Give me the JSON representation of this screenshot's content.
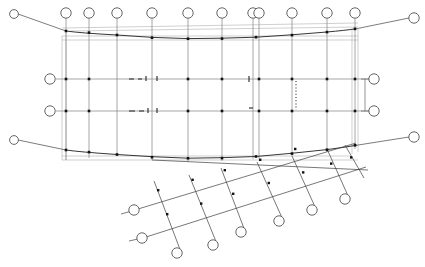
{
  "drawing": {
    "title": "Structural Column Grid Plan",
    "background_color": "#ffffff",
    "line_color": "#8a8a8a",
    "edge_color": "#2b2b2b",
    "node_color": "#111111",
    "bubble_fill": "#ffffff",
    "bubble_stroke": "#555555",
    "width": 425,
    "height": 267,
    "bubble_radius": 5.2,
    "node_size": 2.6
  },
  "chart_data": {
    "type": "scatter",
    "xlabel": "",
    "ylabel": "",
    "grid": true,
    "legend_position": "none"
  },
  "main_grid": {
    "columns": [
      {
        "name": "col-1",
        "x": 66,
        "bubble": {
          "cx": 66,
          "cy": 13,
          "r": 5.2
        },
        "top_y": 31,
        "bottom_y": 158
      },
      {
        "name": "col-2",
        "x": 89,
        "bubble": {
          "cx": 89,
          "cy": 13,
          "r": 5.2
        },
        "top_y": 32,
        "bottom_y": 155
      },
      {
        "name": "col-3",
        "x": 117,
        "bubble": {
          "cx": 117,
          "cy": 13,
          "r": 5.2
        },
        "top_y": 34,
        "bottom_y": 153
      },
      {
        "name": "col-4",
        "x": 152,
        "bubble": {
          "cx": 152,
          "cy": 13,
          "r": 5.2
        },
        "top_y": 37,
        "bottom_y": 157
      },
      {
        "name": "col-5",
        "x": 188,
        "bubble": {
          "cx": 188,
          "cy": 13,
          "r": 5.2
        },
        "top_y": 38,
        "bottom_y": 159
      },
      {
        "name": "col-6",
        "x": 222,
        "bubble": {
          "cx": 222,
          "cy": 13,
          "r": 5.2
        },
        "top_y": 38,
        "bottom_y": 158
      },
      {
        "name": "col-7",
        "x": 256,
        "bubble": {
          "cx": 253,
          "cy": 13,
          "r": 5.2
        },
        "top_y": 37,
        "bottom_y": 156
      },
      {
        "name": "col-7b",
        "x": 261,
        "bubble": {
          "cx": 259,
          "cy": 13,
          "r": 5.2
        },
        "top_y": 37,
        "bottom_y": 156
      },
      {
        "name": "col-8",
        "x": 292,
        "bubble": {
          "cx": 292,
          "cy": 13,
          "r": 5.2
        },
        "top_y": 34,
        "bottom_y": 153
      },
      {
        "name": "col-9",
        "x": 327,
        "bubble": {
          "cx": 327,
          "cy": 13,
          "r": 5.2
        },
        "top_y": 32,
        "bottom_y": 149
      },
      {
        "name": "col-10",
        "x": 355,
        "bubble": {
          "cx": 355,
          "cy": 13,
          "r": 5.2
        },
        "top_y": 29,
        "bottom_y": 146
      }
    ],
    "rows": [
      {
        "name": "row-A",
        "y": 79,
        "bubble_left": {
          "cx": 50,
          "cy": 79,
          "r": 5.2
        },
        "bubble_right": {
          "cx": 374,
          "cy": 79,
          "r": 5.2
        }
      },
      {
        "name": "row-B",
        "y": 111,
        "bubble_left": {
          "cx": 50,
          "cy": 111,
          "r": 5.2
        },
        "bubble_right": {
          "cx": 374,
          "cy": 111,
          "r": 5.2
        }
      }
    ],
    "corner_bubbles": [
      {
        "name": "bubble-top-left",
        "cx": 14,
        "cy": 14,
        "r": 4.4
      },
      {
        "name": "bubble-top-right",
        "cx": 414,
        "cy": 18,
        "r": 5.2
      },
      {
        "name": "bubble-bottom-left",
        "cx": 14,
        "cy": 140,
        "r": 4.4
      },
      {
        "name": "bubble-bottom-right",
        "cx": 414,
        "cy": 137,
        "r": 5.2
      }
    ],
    "outline_left_x": 62,
    "outline_right_x": 357,
    "outline_top_y": 36,
    "outline_bottom_y": 160
  },
  "angled_grid": {
    "rotation_note": "secondary grid rotated approx 20 degrees, lower right quadrant",
    "rail_bubbles": [
      {
        "name": "angled-bubble-1",
        "cx": 134,
        "cy": 210,
        "r": 5.2
      },
      {
        "name": "angled-bubble-2",
        "cx": 142,
        "cy": 238,
        "r": 5.2
      },
      {
        "name": "angled-bubble-3",
        "cx": 177,
        "cy": 253,
        "r": 5.2
      },
      {
        "name": "angled-bubble-4",
        "cx": 213,
        "cy": 245,
        "r": 5.2
      },
      {
        "name": "angled-bubble-5",
        "cx": 241,
        "cy": 232,
        "r": 5.2
      },
      {
        "name": "angled-bubble-6",
        "cx": 279,
        "cy": 221,
        "r": 5.2
      },
      {
        "name": "angled-bubble-7",
        "cx": 312,
        "cy": 210,
        "r": 5.2
      },
      {
        "name": "angled-bubble-8",
        "cx": 345,
        "cy": 199,
        "r": 5.2
      }
    ]
  }
}
